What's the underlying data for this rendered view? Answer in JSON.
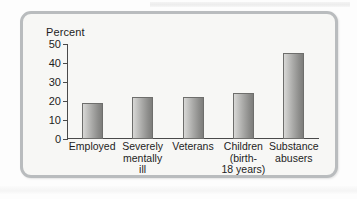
{
  "figure": {
    "frame_color": "#b9bcbe",
    "panel_background": "#f7f7f5"
  },
  "chart_data": {
    "type": "bar",
    "title": "",
    "xlabel": "",
    "ylabel": "Percent",
    "ylim": [
      0,
      50
    ],
    "yticks": [
      0,
      10,
      20,
      30,
      40,
      50
    ],
    "ytick_labels": [
      "0",
      "10",
      "20",
      "30",
      "40",
      "50"
    ],
    "grid": false,
    "legend": false,
    "categories": [
      "Employed",
      "Severely\nmentally\nill",
      "Veterans",
      "Children\n(birth-\n18 years)",
      "Substance\nabusers"
    ],
    "values": [
      19,
      22,
      22,
      24,
      45.5
    ],
    "bar_color": "#a9a9a7",
    "bar_edge_color": "#6e6e6c",
    "axis_color": "#4a4a4a",
    "text_color": "#1d1d1d"
  }
}
